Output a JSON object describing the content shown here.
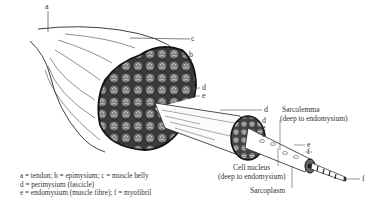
{
  "figure": {
    "colors": {
      "ink": "#2a2a2a",
      "fill_dark": "#555555",
      "fill_light": "#f4f4f4"
    }
  },
  "labels": {
    "a": "a",
    "c": "c",
    "b": "b",
    "f_belly": "f",
    "d_belly": "d",
    "e_belly": "e",
    "d_fascicle_top": "d",
    "d_fascicle": "d",
    "e_fascicle": "e",
    "f_fascicle": "f",
    "sarcolemma": "Sarcolemma",
    "sarcolemma_note": "(deep to endomysium)",
    "e_fibre": "e",
    "f_fibre": "f",
    "cell_nucleus": "Cell nucleus",
    "cell_nucleus_note": "(deep to endomysium)",
    "sarcoplasm": "Sarcoplasm",
    "f_myofibril": "f"
  },
  "legend": {
    "line1": "a = tendon; b = epimysium; c = muscle belly",
    "line2": "d = perimysium (fascicle)",
    "line3": "e = endomysium (muscle fibre); f = myofibril"
  }
}
